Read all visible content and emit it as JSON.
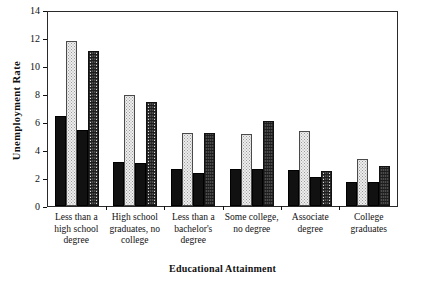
{
  "chart_data": {
    "type": "bar",
    "title": "",
    "xlabel": "Educational Attainment",
    "ylabel": "Unemployment Rate",
    "ylim": [
      0,
      14
    ],
    "yticks": [
      0,
      2,
      4,
      6,
      8,
      10,
      12,
      14
    ],
    "grid": false,
    "legend": "none",
    "categories": [
      "Less than a high school degree",
      "High school graduates, no college",
      "Less than a bachelor's degree",
      "Some college, no degree",
      "Associate degree",
      "College graduates"
    ],
    "category_lines": [
      [
        "Less than a",
        "high school",
        "degree"
      ],
      [
        "High school",
        "graduates, no",
        "college"
      ],
      [
        "Less than a",
        "bachelor's",
        "degree"
      ],
      [
        "Some college,",
        "no degree"
      ],
      [
        "Associate",
        "degree"
      ],
      [
        "College",
        "graduates"
      ]
    ],
    "series": [
      {
        "name": "series-1",
        "fill": "solid-black",
        "values": [
          6.5,
          3.2,
          2.7,
          2.7,
          2.6,
          1.7
        ]
      },
      {
        "name": "series-2",
        "fill": "light-stipple",
        "values": [
          11.9,
          8.0,
          5.3,
          5.2,
          5.4,
          3.4
        ]
      },
      {
        "name": "series-3",
        "fill": "solid-black",
        "values": [
          5.5,
          3.1,
          2.4,
          2.7,
          2.1,
          1.7
        ]
      },
      {
        "name": "series-4",
        "fill": "dark-mottle",
        "values": [
          11.2,
          7.5,
          5.3,
          6.1,
          2.5,
          2.9
        ]
      }
    ],
    "colors": {
      "solid-black": "#111111",
      "light-stipple": "#ededed",
      "dark-mottle": "#4b4b4b",
      "axis": "#2a2a2a",
      "background": "#ffffff"
    }
  }
}
